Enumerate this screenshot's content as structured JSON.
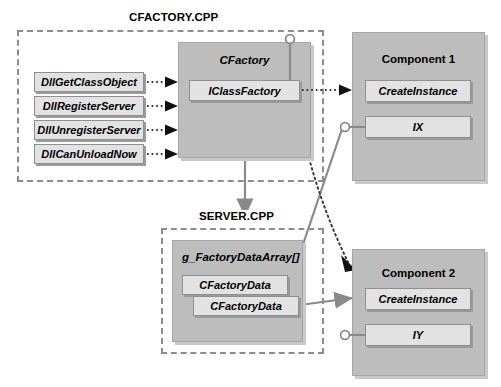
{
  "diagram": {
    "colors": {
      "container_gray": "#bdbdbd",
      "inner_gray": "#e2e2e2",
      "border_gray": "#8f8f8f",
      "dash_gray": "#8d8d8d",
      "connector_gray": "#8a8a8a",
      "text": "#000000",
      "background": "#ffffff"
    }
  },
  "regions": [
    {
      "id": "cfactory-cpp",
      "label": "CFACTORY.CPP"
    },
    {
      "id": "server-cpp",
      "label": "SERVER.CPP"
    }
  ],
  "entry_points": {
    "items": [
      {
        "label": "DllGetClassObject"
      },
      {
        "label": "DllRegisterServer"
      },
      {
        "label": "DllUnregisterServer"
      },
      {
        "label": "DllCanUnloadNow"
      }
    ]
  },
  "cfactory": {
    "title": "CFactory",
    "interface": "IClassFactory"
  },
  "server": {
    "title": "g_FactoryDataArray[]",
    "entries": [
      {
        "label": "CFactoryData"
      },
      {
        "label": "CFactoryData"
      }
    ]
  },
  "component1": {
    "title": "Component 1",
    "members": [
      {
        "label": "CreateInstance"
      },
      {
        "label": "IX"
      }
    ]
  },
  "component2": {
    "title": "Component 2",
    "members": [
      {
        "label": "CreateInstance"
      },
      {
        "label": "IY"
      }
    ]
  },
  "connectors": [
    {
      "id": "dll-to-cfactory-1",
      "style": "dotted-arrow",
      "from": "DllGetClassObject",
      "to": "CFactory"
    },
    {
      "id": "dll-to-cfactory-2",
      "style": "dotted-arrow",
      "from": "DllRegisterServer",
      "to": "CFactory"
    },
    {
      "id": "dll-to-cfactory-3",
      "style": "dotted-arrow",
      "from": "DllUnregisterServer",
      "to": "CFactory"
    },
    {
      "id": "dll-to-cfactory-4",
      "style": "dotted-arrow",
      "from": "DllCanUnloadNow",
      "to": "CFactory"
    },
    {
      "id": "iclassfactory-to-component1",
      "style": "dotted-arrow",
      "from": "IClassFactory",
      "to": "Component 1 CreateInstance"
    },
    {
      "id": "iclassfactory-to-component2",
      "style": "dotted-arrow",
      "from": "IClassFactory",
      "to": "Component 2"
    },
    {
      "id": "cfactory-to-server",
      "style": "solid-arrow",
      "from": "CFactory",
      "to": "SERVER.CPP"
    },
    {
      "id": "cfactorydata1-to-ix",
      "style": "solid-line",
      "from": "CFactoryData",
      "to": "Component 1 IX"
    },
    {
      "id": "cfactorydata2-to-component2",
      "style": "solid-arrow",
      "from": "CFactoryData",
      "to": "Component 2 CreateInstance"
    },
    {
      "id": "cfactory-lollipop",
      "style": "lollipop",
      "from": "CFactory",
      "to": "IClassFactory"
    },
    {
      "id": "ix-lollipop",
      "style": "lollipop",
      "from": "IX",
      "to": "Component 1"
    },
    {
      "id": "iy-lollipop",
      "style": "lollipop",
      "from": "IY",
      "to": "Component 2"
    }
  ]
}
